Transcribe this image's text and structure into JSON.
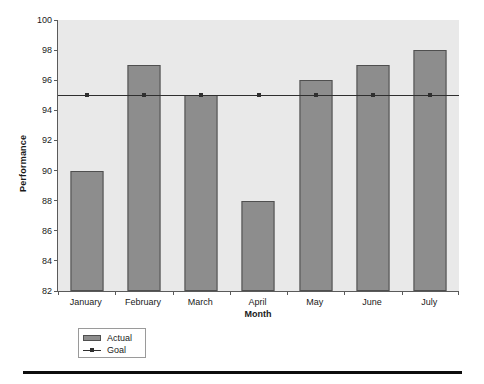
{
  "chart_data": {
    "type": "bar",
    "title": "",
    "xlabel": "Month",
    "ylabel": "Performance",
    "categories": [
      "January",
      "February",
      "March",
      "April",
      "May",
      "June",
      "July"
    ],
    "series": [
      {
        "name": "Actual",
        "type": "bar",
        "values": [
          90,
          97,
          95,
          88,
          96,
          97,
          98
        ]
      },
      {
        "name": "Goal",
        "type": "line",
        "values": [
          95,
          95,
          95,
          95,
          95,
          95,
          95
        ]
      }
    ],
    "ylim": [
      82,
      100
    ],
    "yticks": [
      82,
      84,
      86,
      88,
      90,
      92,
      94,
      96,
      98,
      100
    ],
    "ytick_labels": [
      "82",
      "84",
      "86",
      "88",
      "90",
      "92",
      "94",
      "96",
      "98",
      "100"
    ],
    "grid": false,
    "legend_position": "below-left",
    "legend_entries": [
      {
        "label": "Actual",
        "marker": "bar-swatch",
        "color": "#8d8d8d"
      },
      {
        "label": "Goal",
        "marker": "line-with-point",
        "color": "#2f2f2f"
      }
    ],
    "colors": {
      "bar_fill": "#8d8d8d",
      "bar_edge": "#4f4f4f",
      "goal_line": "#2f2f2f",
      "plot_background": "#e9e9e9",
      "axis": "#5a5a5a",
      "text": "#1a1a1a",
      "rule": "#0d0d0d"
    }
  }
}
